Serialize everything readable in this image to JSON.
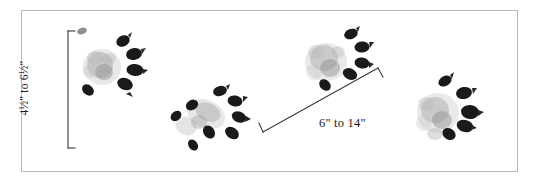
{
  "figure": {
    "background_color": "#ffffff",
    "frame_color": "#b9b9b9",
    "ink_color": "#1a1a1a",
    "pad_color": "#9a9a9a",
    "bracket_color": "#3a3a3a"
  },
  "measurements": {
    "track_height": {
      "text": "4½\" to 6½\"",
      "orientation": "vertical",
      "bracket": {
        "x": 68,
        "y_top": 31,
        "y_bottom": 148,
        "tick": 7
      }
    },
    "stride_length": {
      "text": "6\" to 14\"",
      "orientation": "diagonal",
      "bracket": {
        "x1": 263,
        "y1": 132,
        "x2": 378,
        "y2": 68,
        "tick": 8
      }
    }
  },
  "tracks": [
    {
      "name": "track-front-left",
      "left": 68,
      "top": 24,
      "width": 82,
      "height": 78,
      "rotation": -8,
      "toes": 5,
      "label": "paw print 1"
    },
    {
      "name": "track-hind-left",
      "left": 162,
      "top": 84,
      "width": 90,
      "height": 72,
      "rotation": 28,
      "toes": 5,
      "label": "paw print 2"
    },
    {
      "name": "track-front-right",
      "left": 292,
      "top": 24,
      "width": 88,
      "height": 76,
      "rotation": 14,
      "toes": 5,
      "label": "paw print 3"
    },
    {
      "name": "track-hind-right",
      "left": 404,
      "top": 68,
      "width": 86,
      "height": 82,
      "rotation": -6,
      "toes": 5,
      "label": "paw print 4"
    }
  ]
}
